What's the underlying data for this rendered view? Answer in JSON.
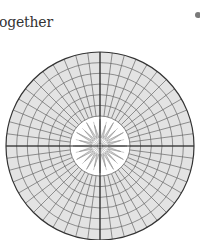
{
  "page": {
    "heading_text": "ogether",
    "bullet_color": "#7a7a7a"
  },
  "diagram": {
    "type": "polar-grid",
    "center": [
      100,
      146
    ],
    "outer_radius": 94,
    "inner_radius": 30,
    "ring_count": 6,
    "spoke_count": 48,
    "star_points": 24,
    "colors": {
      "grid_fill": "#e3e3e3",
      "grid_line": "#666666",
      "axis_line": "#222222",
      "outer_stroke": "#333333",
      "inner_fill": "#ffffff",
      "star_line": "#999999"
    }
  }
}
